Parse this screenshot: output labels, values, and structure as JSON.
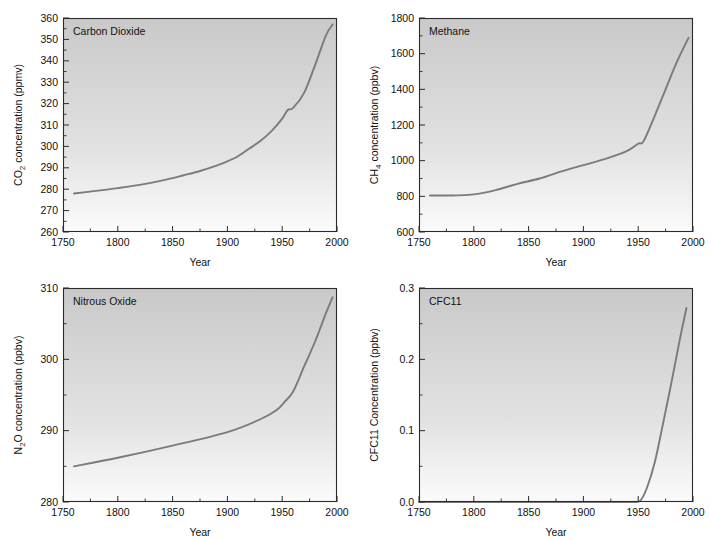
{
  "figure": {
    "name": "atmospheric-greenhouse-gas-concentrations",
    "background": "#ffffff",
    "curve_color": "#7b7b7b",
    "axis_color": "#2b2b2b",
    "panel_fill_top": "#c9c9c9",
    "panel_fill_bottom": "#fbfbfb",
    "panel_count": 4
  },
  "common": {
    "xlabel": "Year",
    "x_ticks": [
      "1750",
      "1800",
      "1850",
      "1900",
      "1950",
      "2000"
    ],
    "x_tick_values": [
      1750,
      1800,
      1850,
      1900,
      1950,
      2000
    ],
    "x_minor_values": [
      1775,
      1825,
      1875,
      1925,
      1975
    ],
    "xlim": [
      1750,
      2000
    ]
  },
  "panels": {
    "co2": {
      "label": "Carbon Dioxide",
      "ylabel_prefix": "CO",
      "ylabel_sub": "2",
      "ylabel_suffix": " concentration (ppmv)",
      "ylabel_full": "CO2 concentration (ppmv)",
      "y_ticks": [
        "260",
        "270",
        "280",
        "290",
        "300",
        "310",
        "320",
        "330",
        "340",
        "350",
        "360"
      ],
      "y_tick_values": [
        260,
        270,
        280,
        290,
        300,
        310,
        320,
        330,
        340,
        350,
        360
      ],
      "y_minor_values": [
        265,
        275,
        285,
        295,
        305,
        315,
        325,
        335,
        345,
        355
      ],
      "ylim": [
        260,
        360
      ]
    },
    "ch4": {
      "label": "Methane",
      "ylabel_prefix": "CH",
      "ylabel_sub": "4",
      "ylabel_suffix": " concentration (ppbv)",
      "ylabel_full": "CH4 concentration (ppbv)",
      "y_ticks": [
        "600",
        "800",
        "1000",
        "1200",
        "1400",
        "1600",
        "1800"
      ],
      "y_tick_values": [
        600,
        800,
        1000,
        1200,
        1400,
        1600,
        1800
      ],
      "y_minor_values": [
        700,
        900,
        1100,
        1300,
        1500,
        1700
      ],
      "ylim": [
        600,
        1800
      ]
    },
    "n2o": {
      "label": "Nitrous Oxide",
      "ylabel_prefix": "N",
      "ylabel_sub": "2",
      "ylabel_suffix": "O concentration (ppbv)",
      "ylabel_full": "N2O concentration (ppbv)",
      "y_ticks": [
        "280",
        "290",
        "300",
        "310"
      ],
      "y_tick_values": [
        280,
        290,
        300,
        310
      ],
      "y_minor_values": [
        285,
        295,
        305
      ],
      "ylim": [
        280,
        310
      ]
    },
    "cfc11": {
      "label": "CFC11",
      "ylabel_prefix": "CFC11 Concentration (ppbv)",
      "ylabel_sub": "",
      "ylabel_suffix": "",
      "ylabel_full": "CFC11 Concentration (ppbv)",
      "y_ticks": [
        "0.0",
        "0.1",
        "0.2",
        "0.3"
      ],
      "y_tick_values": [
        0.0,
        0.1,
        0.2,
        0.3
      ],
      "y_minor_values": [
        0.05,
        0.15,
        0.25
      ],
      "ylim": [
        0.0,
        0.3
      ]
    }
  },
  "chart_data": [
    {
      "type": "line",
      "id": "co2",
      "title": "Carbon Dioxide",
      "xlabel": "Year",
      "ylabel": "CO2 concentration (ppmv)",
      "xlim": [
        1750,
        2000
      ],
      "ylim": [
        260,
        360
      ],
      "grid": false,
      "legend": "none",
      "x": [
        1760,
        1780,
        1800,
        1820,
        1840,
        1860,
        1875,
        1890,
        1900,
        1910,
        1920,
        1930,
        1940,
        1950,
        1955,
        1960,
        1970,
        1980,
        1990,
        1996
      ],
      "y": [
        278,
        279.2,
        280.5,
        282,
        284,
        286.5,
        288.5,
        291,
        293,
        295.5,
        299,
        302.5,
        307,
        313,
        317,
        318,
        325,
        338,
        352,
        357
      ]
    },
    {
      "type": "line",
      "id": "ch4",
      "title": "Methane",
      "xlabel": "Year",
      "ylabel": "CH4 concentration (ppbv)",
      "xlim": [
        1750,
        2000
      ],
      "ylim": [
        600,
        1800
      ],
      "grid": false,
      "legend": "none",
      "x": [
        1760,
        1780,
        1795,
        1805,
        1820,
        1840,
        1860,
        1880,
        1900,
        1920,
        1940,
        1950,
        1955,
        1965,
        1975,
        1985,
        1996
      ],
      "y": [
        805,
        805,
        808,
        815,
        835,
        870,
        900,
        940,
        975,
        1010,
        1055,
        1095,
        1110,
        1250,
        1400,
        1550,
        1690
      ]
    },
    {
      "type": "line",
      "id": "n2o",
      "title": "Nitrous Oxide",
      "xlabel": "Year",
      "ylabel": "N2O concentration (ppbv)",
      "xlim": [
        1750,
        2000
      ],
      "ylim": [
        280,
        310
      ],
      "grid": false,
      "legend": "none",
      "x": [
        1760,
        1800,
        1850,
        1900,
        1930,
        1945,
        1952,
        1960,
        1970,
        1980,
        1990,
        1996
      ],
      "y": [
        285,
        286.2,
        287.9,
        289.8,
        291.6,
        292.9,
        294,
        295.5,
        299,
        302.5,
        306.5,
        308.7
      ]
    },
    {
      "type": "line",
      "id": "cfc11",
      "title": "CFC11",
      "xlabel": "Year",
      "ylabel": "CFC11 Concentration (ppbv)",
      "xlim": [
        1750,
        2000
      ],
      "ylim": [
        0.0,
        0.3
      ],
      "grid": false,
      "legend": "none",
      "x": [
        1750,
        1930,
        1945,
        1952,
        1958,
        1965,
        1972,
        1980,
        1988,
        1994
      ],
      "y": [
        0.0,
        0.0,
        0.0,
        0.002,
        0.02,
        0.055,
        0.105,
        0.165,
        0.228,
        0.272
      ]
    }
  ]
}
